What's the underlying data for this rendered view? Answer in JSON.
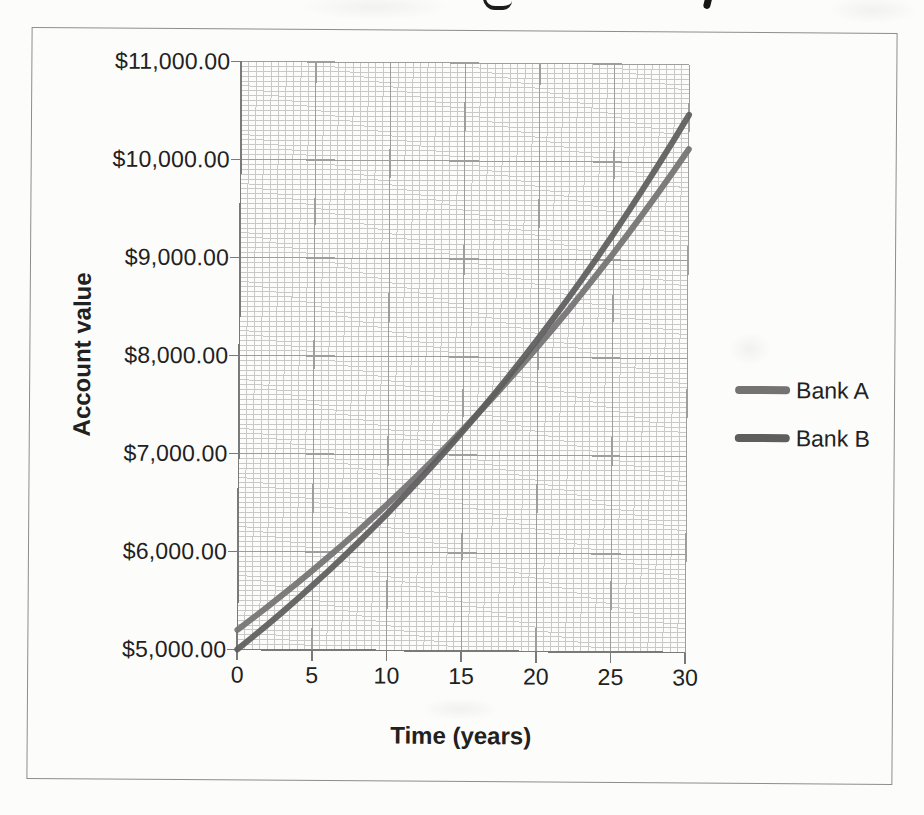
{
  "figure": {
    "y_axis": {
      "title": "Account value",
      "tick_labels": [
        "$11,000.00",
        "$10,000.00",
        "$9,000.00",
        "$8,000.00",
        "$7,000.00",
        "$6,000.00",
        "$5,000.00"
      ]
    },
    "x_axis": {
      "title": "Time (years)",
      "tick_labels": [
        "0",
        "5",
        "10",
        "15",
        "20",
        "25",
        "30"
      ]
    }
  },
  "chart_data": {
    "type": "line",
    "title": "",
    "xlabel": "Time (years)",
    "ylabel": "Account value",
    "x": [
      0,
      1,
      2,
      3,
      4,
      5,
      6,
      7,
      8,
      9,
      10,
      11,
      12,
      13,
      14,
      15,
      16,
      17,
      18,
      19,
      20,
      21,
      22,
      23,
      24,
      25,
      26,
      27,
      28,
      29,
      30
    ],
    "series": [
      {
        "name": "Bank A",
        "color": "#747272",
        "values": [
          5200,
          5317,
          5437,
          5559,
          5684,
          5812,
          5943,
          6076,
          6213,
          6353,
          6496,
          6642,
          6791,
          6944,
          7100,
          7260,
          7423,
          7590,
          7761,
          7936,
          8114,
          8297,
          8484,
          8675,
          8870,
          9069,
          9273,
          9482,
          9695,
          9913,
          10136
        ]
      },
      {
        "name": "Bank B",
        "color": "#5f5e5e",
        "values": [
          5000,
          5125,
          5253,
          5384,
          5519,
          5657,
          5798,
          5943,
          6092,
          6244,
          6400,
          6560,
          6724,
          6892,
          7065,
          7241,
          7422,
          7608,
          7798,
          7993,
          8193,
          8398,
          8608,
          8823,
          9043,
          9269,
          9501,
          9738,
          9982,
          10231,
          10487
        ]
      }
    ],
    "xlim": [
      0,
      30
    ],
    "ylim": [
      5000,
      11000
    ],
    "x_major_step": 5,
    "x_minor_step": 0.5,
    "y_major_step": 1000,
    "y_minor_step": 50,
    "grid": "major and minor gridlines on",
    "legend_position": "right"
  },
  "palette": {
    "paper": "#fcfcfa",
    "figure_border": "#8d8d8d",
    "grid_minor": "#c9c9c9",
    "grid_major": "#9e9e9e",
    "axis_line": "#7a7a7a",
    "text": "#212121"
  }
}
